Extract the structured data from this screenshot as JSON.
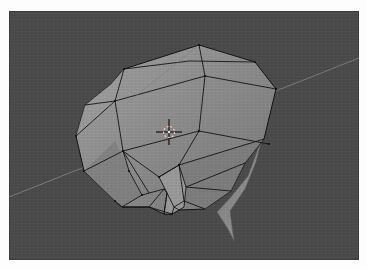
{
  "app": {
    "type": "3d-viewport",
    "view": "perspective",
    "mode": "edit-mesh-wireframe-over-solid"
  },
  "viewport": {
    "background_color": "#4a4a4a",
    "mesh_face_color": "#8a8a8a",
    "mesh_face_light_color": "#9a9a9a",
    "mesh_face_dark_color": "#6e6e6e",
    "mesh_edge_color": "#111111",
    "horizon_line_color": "#8c8c8c",
    "cursor_ring_colors": [
      "#e8e8e8",
      "#d04040"
    ]
  },
  "objects": [
    {
      "name": "low-poly-head-mesh",
      "selected": true
    },
    {
      "name": "3d-cursor"
    },
    {
      "name": "ground-grid-axis-line"
    }
  ],
  "icons": {
    "cursor": "3d-cursor-icon"
  }
}
